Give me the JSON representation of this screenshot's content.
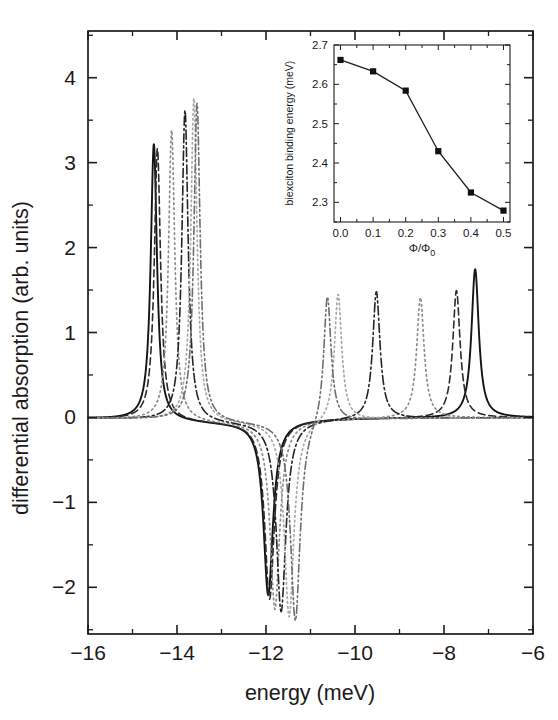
{
  "figure": {
    "title": "",
    "background": "#ffffff"
  },
  "main_axes": {
    "xlabel": "energy (meV)",
    "ylabel": "differential absorption (arb. units)",
    "xticks": [
      "-16",
      "-14",
      "-12",
      "-10",
      "-8",
      "-6"
    ],
    "xtick_values": [
      -16,
      -14,
      -12,
      -10,
      -8,
      -6
    ],
    "yticks": [
      "-2",
      "-1",
      "0",
      "1",
      "2",
      "3",
      "4"
    ],
    "ytick_values": [
      -2,
      -1,
      0,
      1,
      2,
      3,
      4
    ],
    "xlim": [
      -16,
      -6
    ],
    "ylim": [
      -2.55,
      4.55
    ]
  },
  "inset_axes": {
    "xlabel": "Φ/Φ",
    "xlabel_sub": "0",
    "ylabel": "biexciton binding energy (meV)",
    "xticks": [
      "0.0",
      "0.1",
      "0.2",
      "0.3",
      "0.4",
      "0.5"
    ],
    "xtick_values": [
      0.0,
      0.1,
      0.2,
      0.3,
      0.4,
      0.5
    ],
    "yticks": [
      "2.3",
      "2.4",
      "2.5",
      "2.6",
      "2.7"
    ],
    "ytick_values": [
      2.3,
      2.4,
      2.5,
      2.6,
      2.7
    ],
    "xlim": [
      -0.02,
      0.52
    ],
    "ylim": [
      2.25,
      2.7
    ]
  },
  "chart_data": [
    {
      "type": "line",
      "title": "",
      "xlabel": "energy (meV)",
      "ylabel": "differential absorption (arb. units)",
      "xlim": [
        -16,
        -6
      ],
      "ylim": [
        -2.55,
        4.55
      ],
      "grid": false,
      "legend": "none",
      "notes": "Six differential absorption spectra for flux values Φ/Φ₀ = 0.0 to 0.5. Each curve has a positive biexciton peak at low energy, a negative exciton dip near -12 meV, and a positive exciton peak at higher energy.",
      "series": [
        {
          "name": "Φ/Φ₀ = 0.0",
          "style": "solid",
          "color": "#141414",
          "width": 1.9,
          "dash": "none",
          "peak_left": {
            "x": -14.52,
            "y": 3.25,
            "width": 0.085
          },
          "dip": {
            "x": -11.95,
            "y": -2.05,
            "width": 0.13
          },
          "peak_right": {
            "x": -7.3,
            "y": 1.75,
            "width": 0.1
          }
        },
        {
          "name": "Φ/Φ₀ = 0.1",
          "style": "dashed",
          "color": "#2b2b2b",
          "width": 1.6,
          "dash": "7,4",
          "peak_left": {
            "x": -14.44,
            "y": 3.2,
            "width": 0.085
          },
          "dip": {
            "x": -11.92,
            "y": -2.1,
            "width": 0.13
          },
          "peak_right": {
            "x": -7.72,
            "y": 1.5,
            "width": 0.1
          }
        },
        {
          "name": "Φ/Φ₀ = 0.2",
          "style": "dotted",
          "color": "#8c8c8c",
          "width": 1.7,
          "dash": "1.6,3.4",
          "peak_left": {
            "x": -14.12,
            "y": 3.42,
            "width": 0.085
          },
          "dip": {
            "x": -11.8,
            "y": -2.22,
            "width": 0.13
          },
          "peak_right": {
            "x": -8.53,
            "y": 1.42,
            "width": 0.1
          }
        },
        {
          "name": "Φ/Φ₀ = 0.3",
          "style": "dash-dot",
          "color": "#242424",
          "width": 1.6,
          "dash": "9,3.2,2,3.2",
          "peak_left": {
            "x": -13.82,
            "y": 3.66,
            "width": 0.085
          },
          "dip": {
            "x": -11.66,
            "y": -2.25,
            "width": 0.13
          },
          "peak_right": {
            "x": -9.52,
            "y": 1.5,
            "width": 0.1
          }
        },
        {
          "name": "Φ/Φ₀ = 0.4",
          "style": "dotted-light",
          "color": "#a8a8a8",
          "width": 1.7,
          "dash": "1.6,3.2",
          "peak_left": {
            "x": -13.62,
            "y": 3.8,
            "width": 0.085
          },
          "dip": {
            "x": -11.48,
            "y": -2.32,
            "width": 0.13
          },
          "peak_right": {
            "x": -10.38,
            "y": 1.5,
            "width": 0.1
          }
        },
        {
          "name": "Φ/Φ₀ = 0.5",
          "style": "dash-dot-dot",
          "color": "#6e6e6e",
          "width": 1.6,
          "dash": "8,3,1.8,3,1.8,3",
          "peak_left": {
            "x": -13.55,
            "y": 3.74,
            "width": 0.085
          },
          "dip": {
            "x": -11.34,
            "y": -2.38,
            "width": 0.13
          },
          "peak_right": {
            "x": -10.62,
            "y": 1.52,
            "width": 0.1
          }
        }
      ]
    },
    {
      "type": "line",
      "inset": true,
      "title": "",
      "xlabel": "Φ/Φ₀",
      "ylabel": "biexciton binding energy (meV)",
      "xlim": [
        -0.02,
        0.52
      ],
      "ylim": [
        2.25,
        2.7
      ],
      "grid": false,
      "legend": "none",
      "marker": "filled-square",
      "x": [
        0.0,
        0.1,
        0.2,
        0.3,
        0.4,
        0.5
      ],
      "values": [
        2.662,
        2.633,
        2.584,
        2.43,
        2.325,
        2.279
      ]
    }
  ]
}
